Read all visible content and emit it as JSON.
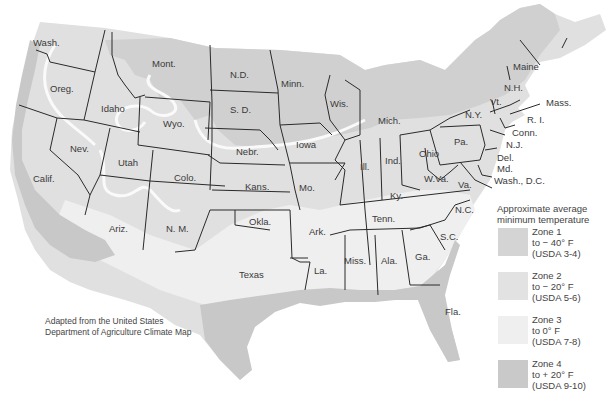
{
  "map": {
    "title": "Approximate average minimum temperature",
    "colors": {
      "zone1": "#d4d4d4",
      "zone2": "#e2e2e2",
      "zone3": "#efefef",
      "zone4": "#c9c9c9",
      "border": "#2a2a2a",
      "background": "#ffffff"
    },
    "states": [
      {
        "name": "Wash.",
        "x": 33,
        "y": 46
      },
      {
        "name": "Oreg.",
        "x": 50,
        "y": 92
      },
      {
        "name": "Idaho",
        "x": 101,
        "y": 112
      },
      {
        "name": "Mont.",
        "x": 152,
        "y": 67
      },
      {
        "name": "Wyo.",
        "x": 163,
        "y": 127
      },
      {
        "name": "N.D.",
        "x": 230,
        "y": 78
      },
      {
        "name": "S. D.",
        "x": 230,
        "y": 113
      },
      {
        "name": "Minn.",
        "x": 281,
        "y": 87
      },
      {
        "name": "Wis.",
        "x": 330,
        "y": 107
      },
      {
        "name": "Mich.",
        "x": 378,
        "y": 124
      },
      {
        "name": "Nebr.",
        "x": 236,
        "y": 155
      },
      {
        "name": "Iowa",
        "x": 296,
        "y": 148
      },
      {
        "name": "Nev.",
        "x": 70,
        "y": 152
      },
      {
        "name": "Utah",
        "x": 118,
        "y": 166
      },
      {
        "name": "Calif.",
        "x": 33,
        "y": 182
      },
      {
        "name": "Colo.",
        "x": 174,
        "y": 181
      },
      {
        "name": "Kans.",
        "x": 245,
        "y": 190
      },
      {
        "name": "Mo.",
        "x": 299,
        "y": 191
      },
      {
        "name": "Ill.",
        "x": 360,
        "y": 170
      },
      {
        "name": "Ind.",
        "x": 385,
        "y": 164
      },
      {
        "name": "Ohio",
        "x": 419,
        "y": 157
      },
      {
        "name": "Ariz.",
        "x": 109,
        "y": 232
      },
      {
        "name": "N. M.",
        "x": 166,
        "y": 232
      },
      {
        "name": "Okla.",
        "x": 249,
        "y": 225
      },
      {
        "name": "Ark.",
        "x": 309,
        "y": 235
      },
      {
        "name": "Texas",
        "x": 239,
        "y": 278
      },
      {
        "name": "La.",
        "x": 314,
        "y": 274
      },
      {
        "name": "Miss.",
        "x": 344,
        "y": 264
      },
      {
        "name": "Ala.",
        "x": 381,
        "y": 264
      },
      {
        "name": "Ga.",
        "x": 415,
        "y": 260
      },
      {
        "name": "Tenn.",
        "x": 372,
        "y": 222
      },
      {
        "name": "Ky.",
        "x": 390,
        "y": 199
      },
      {
        "name": "N.C.",
        "x": 455,
        "y": 213
      },
      {
        "name": "S.C.",
        "x": 440,
        "y": 240
      },
      {
        "name": "Fla.",
        "x": 445,
        "y": 315
      },
      {
        "name": "W.Va.",
        "x": 424,
        "y": 182
      },
      {
        "name": "Va.",
        "x": 458,
        "y": 188
      },
      {
        "name": "Pa.",
        "x": 454,
        "y": 145
      },
      {
        "name": "N.Y.",
        "x": 465,
        "y": 118
      },
      {
        "name": "Vt.",
        "x": 490,
        "y": 105
      },
      {
        "name": "N.H.",
        "x": 504,
        "y": 91
      },
      {
        "name": "Maine",
        "x": 513,
        "y": 70
      },
      {
        "name": "Mass.",
        "x": 546,
        "y": 106
      },
      {
        "name": "R. I.",
        "x": 527,
        "y": 123
      },
      {
        "name": "Conn.",
        "x": 512,
        "y": 136
      },
      {
        "name": "N.J.",
        "x": 506,
        "y": 148
      },
      {
        "name": "Del.",
        "x": 497,
        "y": 161
      },
      {
        "name": "Md.",
        "x": 497,
        "y": 172
      },
      {
        "name": "Wash., D.C.",
        "x": 494,
        "y": 184
      }
    ],
    "credit": {
      "line1": "Adapted from the United States",
      "line2": "Department of Agriculture Climate Map"
    }
  },
  "legend": {
    "title_line1": "Approximate average",
    "title_line2": "minimum temperature",
    "items": [
      {
        "zone": "Zone 1",
        "temp": "to − 40° F",
        "usda": "(USDA 3-4)",
        "color": "#d4d4d4"
      },
      {
        "zone": "Zone 2",
        "temp": "to − 20° F",
        "usda": "(USDA 5-6)",
        "color": "#e2e2e2"
      },
      {
        "zone": "Zone 3",
        "temp": "to 0° F",
        "usda": "(USDA 7-8)",
        "color": "#efefef"
      },
      {
        "zone": "Zone 4",
        "temp": "to + 20° F",
        "usda": "(USDA 9-10)",
        "color": "#c9c9c9"
      }
    ]
  }
}
